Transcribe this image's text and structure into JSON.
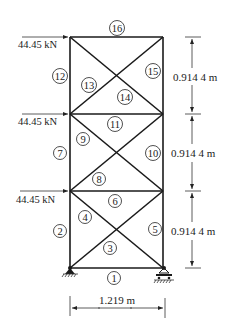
{
  "diagram": {
    "type": "plane truss",
    "nodes": {
      "x_left": 70,
      "x_right": 163,
      "y_levels": [
        37,
        114,
        191,
        268
      ]
    },
    "members": [
      {
        "id": "1",
        "label": "1",
        "from": "bottom-left",
        "to": "bottom-right",
        "kind": "horizontal"
      },
      {
        "id": "2",
        "label": "2",
        "from": "bottom-left",
        "to": "level1-left",
        "kind": "vertical"
      },
      {
        "id": "3",
        "label": "3",
        "from": "bottom-left",
        "to": "level1-right",
        "kind": "diagonal"
      },
      {
        "id": "4",
        "label": "4",
        "from": "level1-left",
        "to": "bottom-right",
        "kind": "diagonal"
      },
      {
        "id": "5",
        "label": "5",
        "from": "bottom-right",
        "to": "level1-right",
        "kind": "vertical"
      },
      {
        "id": "6",
        "label": "6",
        "from": "level1-left",
        "to": "level1-right",
        "kind": "horizontal"
      },
      {
        "id": "7",
        "label": "7",
        "from": "level1-left",
        "to": "level2-left",
        "kind": "vertical"
      },
      {
        "id": "8",
        "label": "8",
        "from": "level1-left",
        "to": "level2-right",
        "kind": "diagonal"
      },
      {
        "id": "9",
        "label": "9",
        "from": "level2-left",
        "to": "level1-right",
        "kind": "diagonal"
      },
      {
        "id": "10",
        "label": "10",
        "from": "level1-right",
        "to": "level2-right",
        "kind": "vertical"
      },
      {
        "id": "11",
        "label": "11",
        "from": "level2-left",
        "to": "level2-right",
        "kind": "horizontal"
      },
      {
        "id": "12",
        "label": "12",
        "from": "level2-left",
        "to": "top-left",
        "kind": "vertical"
      },
      {
        "id": "13",
        "label": "13",
        "from": "level2-left",
        "to": "top-right",
        "kind": "diagonal"
      },
      {
        "id": "14",
        "label": "14",
        "from": "top-left",
        "to": "level2-right",
        "kind": "diagonal"
      },
      {
        "id": "15",
        "label": "15",
        "from": "level2-right",
        "to": "top-right",
        "kind": "vertical"
      },
      {
        "id": "16",
        "label": "16",
        "from": "top-left",
        "to": "top-right",
        "kind": "horizontal"
      }
    ],
    "loads": [
      {
        "label": "44.45 kN",
        "node": "top-left",
        "direction": "right"
      },
      {
        "label": "44.45 kN",
        "node": "level2-left",
        "direction": "right"
      },
      {
        "label": "44.45 kN",
        "node": "level1-left",
        "direction": "right"
      }
    ],
    "supports": [
      {
        "node": "bottom-left",
        "type": "pin"
      },
      {
        "node": "bottom-right",
        "type": "roller"
      }
    ],
    "dimensions": {
      "width": "1.219 m",
      "heights": [
        "0.914 4 m",
        "0.914 4 m",
        "0.914 4 m"
      ]
    },
    "colors": {
      "line": "#1a1a1a",
      "text": "#222222",
      "background": "#ffffff"
    }
  }
}
